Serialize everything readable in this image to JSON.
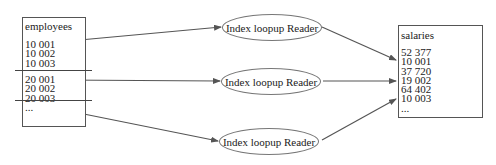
{
  "diagram": {
    "source_table": {
      "title": "employees",
      "groups": [
        {
          "rows": [
            "10 001",
            "10 002",
            "10 003"
          ]
        },
        {
          "rows": [
            "20 001",
            "20 002",
            "20 003"
          ]
        },
        {
          "rows": [
            "..."
          ]
        }
      ]
    },
    "readers": [
      {
        "label": "Index loopup Reader"
      },
      {
        "label": "Index loopup Reader"
      },
      {
        "label": "Index loopup Reader"
      }
    ],
    "target_table": {
      "title": "salaries",
      "rows": [
        "52 377",
        "10 001",
        "37 720",
        "19 002",
        "64 402",
        "10 003",
        "..."
      ]
    },
    "colors": {
      "arrow": "#555555",
      "box_border": "#555555",
      "ellipse_border": "#777777"
    }
  }
}
